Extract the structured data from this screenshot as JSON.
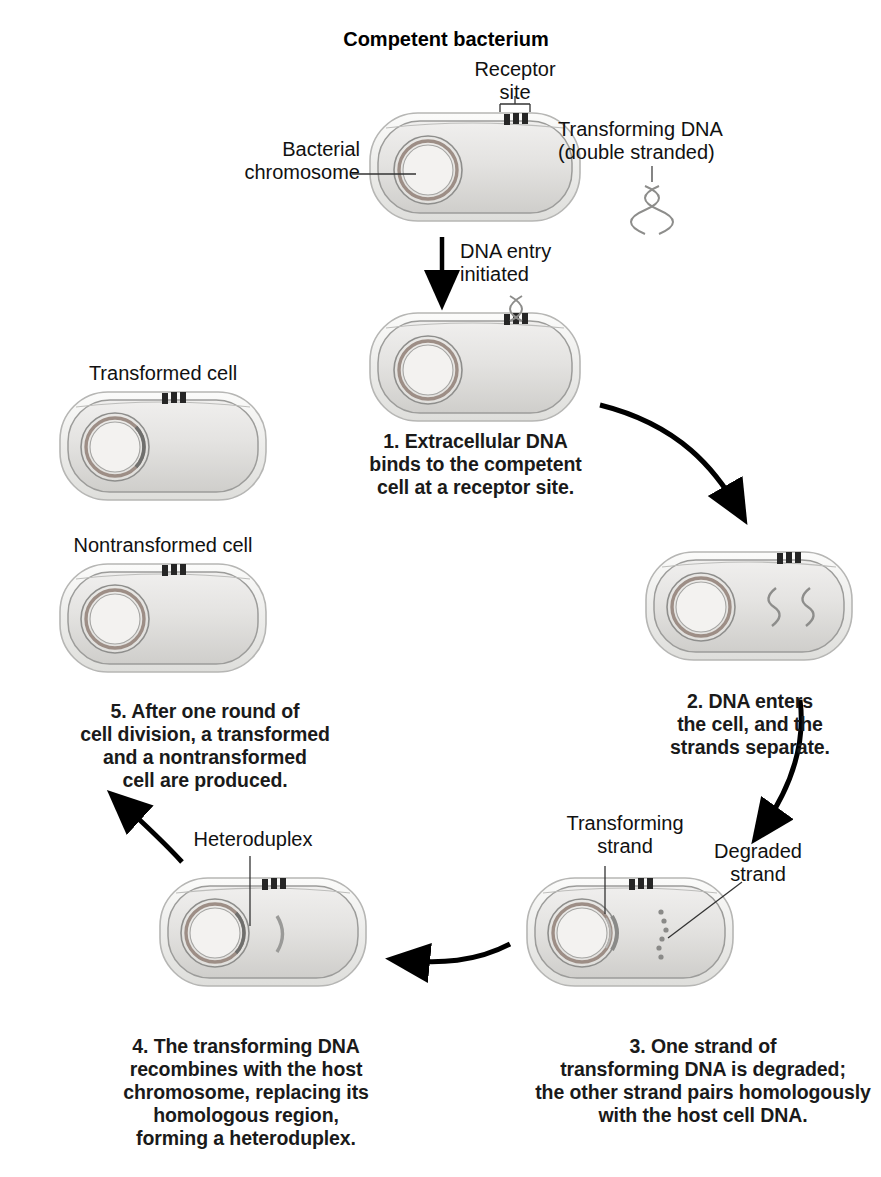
{
  "figure": {
    "type": "process-cycle-diagram",
    "title": "Competent bacterium"
  },
  "labels": {
    "competent_bacterium": "Competent bacterium",
    "receptor_site": "Receptor\nsite",
    "transforming_dna": "Transforming DNA\n(double stranded)",
    "bacterial_chromosome": "Bacterial\nchromosome",
    "dna_entry": "DNA entry\ninitiated",
    "transformed_cell": "Transformed cell",
    "nontransformed_cell": "Nontransformed cell",
    "heteroduplex": "Heteroduplex",
    "transforming_strand": "Transforming\nstrand",
    "degraded_strand": "Degraded\nstrand"
  },
  "steps": [
    {
      "number": "1",
      "caption": "1. Extracellular DNA\nbinds to the competent\ncell at a receptor site."
    },
    {
      "number": "2",
      "caption": "2. DNA enters\nthe cell, and the\nstrands separate."
    },
    {
      "number": "3",
      "caption": "3. One strand of\ntransforming DNA is degraded;\nthe other strand pairs homologously\nwith the host cell DNA."
    },
    {
      "number": "4",
      "caption": "4. The transforming DNA\nrecombines with the host\nchromosome, replacing its\nhomologous region,\nforming a heteroduplex."
    },
    {
      "number": "5",
      "caption": "5. After one round of\ncell division, a transformed\nand a nontransformed\ncell are produced."
    }
  ],
  "colors": {
    "cell_fill": "#e3e3e1",
    "cell_fill_dark": "#cfcfcd",
    "cell_outline": "#9a9a98",
    "wall_outline": "#b4b4b2",
    "chromosome_outer": "#8f8f8d",
    "chromosome_band": "#9c8d86",
    "chromosome_inner": "#efeeec",
    "receptor": "#2b2b2b",
    "dna_strand": "#8a8a88",
    "text": "#111111",
    "arrow": "#000000"
  }
}
